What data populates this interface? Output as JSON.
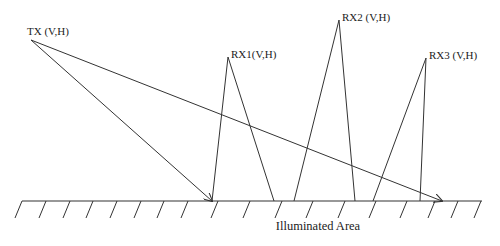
{
  "diagram": {
    "colors": {
      "line": "#333333",
      "text": "#222222",
      "background": "#ffffff"
    },
    "transmitter": {
      "label": "TX (V,H)",
      "x": 31,
      "y": 40
    },
    "receivers": [
      {
        "label": "RX1(V,H)",
        "x": 228,
        "y": 57,
        "left_foot": 212,
        "right_foot": 274
      },
      {
        "label": "RX2 (V,H)",
        "x": 339,
        "y": 20,
        "left_foot": 294,
        "right_foot": 355
      },
      {
        "label": "RX3 (V,H)",
        "x": 426,
        "y": 58,
        "left_foot": 373,
        "right_foot": 420
      }
    ],
    "tx_rays": [
      {
        "to_x": 212,
        "to_y": 201,
        "arrow": true
      },
      {
        "to_x": 442,
        "to_y": 201,
        "arrow": true
      }
    ],
    "ground": {
      "y": 201,
      "x_start": 22,
      "x_end": 482,
      "hatch_x": [
        22,
        46,
        70,
        93,
        117,
        141,
        164,
        188,
        218,
        250,
        282,
        313,
        345,
        376,
        407,
        435,
        458,
        481
      ],
      "label": "Illuminated Area"
    }
  }
}
